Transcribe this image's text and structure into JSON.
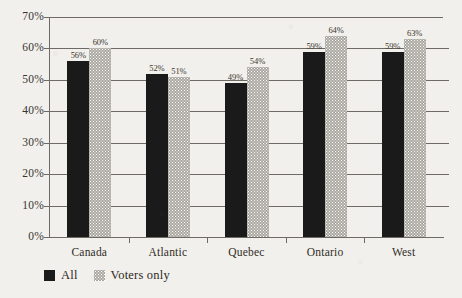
{
  "chart_data": {
    "type": "bar",
    "title": "",
    "subtitle": "",
    "xlabel": "",
    "ylabel": "",
    "ylim": [
      0,
      70
    ],
    "ytick_labels": [
      "0%",
      "10%",
      "20%",
      "30%",
      "40%",
      "50%",
      "60%",
      "70%"
    ],
    "ytick_values": [
      0,
      10,
      20,
      30,
      40,
      50,
      60,
      70
    ],
    "grid": true,
    "legend_position": "bottom-left",
    "categories": [
      "Canada",
      "Atlantic",
      "Quebec",
      "Ontario",
      "West"
    ],
    "series": [
      {
        "name": "All",
        "color": "#1a1a1a",
        "values": [
          56,
          52,
          49,
          59,
          59
        ],
        "labels": [
          "56%",
          "52%",
          "49%",
          "59%",
          "59%"
        ]
      },
      {
        "name": "Voters only",
        "color": "#aaa7a0",
        "values": [
          60,
          51,
          54,
          64,
          63
        ],
        "labels": [
          "60%",
          "51%",
          "54%",
          "64%",
          "63%"
        ]
      }
    ]
  },
  "legend": {
    "items": [
      {
        "label": "All",
        "swatch": "black-square"
      },
      {
        "label": "Voters only",
        "swatch": "stippled-gray-square"
      }
    ]
  },
  "colors": {
    "background": "#f2f0ec",
    "axis": "#6e6a64",
    "series_all": "#1a1a1a",
    "series_voters": "#aaa7a0",
    "text": "#2b2822"
  }
}
